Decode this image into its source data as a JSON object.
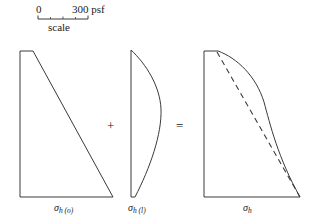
{
  "figure": {
    "kind": "lateral-earth-pressure-superposition-diagram",
    "background_color": "#ffffff",
    "line_color": "#3a3a3a"
  },
  "scale": {
    "zero_label": "0",
    "max_label": "300 psf",
    "caption": "scale",
    "bar": {
      "x_start": 38,
      "x_end": 88,
      "y": 19,
      "tick_count": 5,
      "units": "psf",
      "range": [
        0,
        300
      ]
    }
  },
  "operators": {
    "plus": "+",
    "equals": "="
  },
  "diagrams": [
    {
      "name": "at-rest-pressure",
      "label_sigma": "σ",
      "label_subscript": "h (o)",
      "shape": "triangular",
      "description": "Right triangular pressure distribution increasing linearly with depth",
      "top_y": 51,
      "bottom_y": 197,
      "left_x": 20,
      "top_right_x": 33,
      "bottom_right_x": 113
    },
    {
      "name": "surcharge-line-load-pressure",
      "label_sigma": "σ",
      "label_subscript": "h (l)",
      "shape": "bulb",
      "description": "Bulging lateral pressure from line load, maximum near upper third",
      "top_y": 50,
      "bottom_y": 197,
      "left_x": 131,
      "max_bulge_x": 161,
      "max_bulge_y": 108
    },
    {
      "name": "total-pressure",
      "label_sigma": "σ",
      "label_subscript": "h",
      "shape": "combined-curve",
      "description": "Sum of at-rest and surcharge pressures, with dashed line showing at-rest component",
      "top_y": 51,
      "bottom_y": 197,
      "left_x": 204,
      "top_right_x": 218,
      "bottom_right_x": 300,
      "has_dashed_reference_line": true
    }
  ]
}
